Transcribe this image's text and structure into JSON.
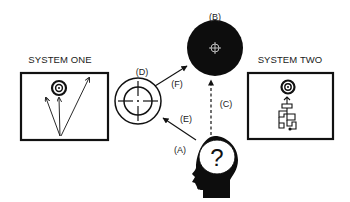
{
  "diagram": {
    "system_one": {
      "title": "SYSTEM ONE",
      "contents": [
        "target-icon",
        "three-arrows-to-target"
      ]
    },
    "system_two": {
      "title": "SYSTEM TWO",
      "contents": [
        "target-icon",
        "maze-path-icon"
      ]
    },
    "nodes": {
      "A": {
        "label": "(A)",
        "icon": "head-with-question-mark-icon"
      },
      "B": {
        "label": "(B)",
        "icon": "black-target-circle-icon"
      },
      "D": {
        "label": "(D)",
        "icon": "crosshair-circle-icon"
      }
    },
    "edges": {
      "C": {
        "label": "(C)",
        "from": "A",
        "to": "B",
        "style": "dashed"
      },
      "E": {
        "label": "(E)",
        "from": "A",
        "to": "D",
        "style": "solid"
      },
      "F": {
        "label": "(F)",
        "from": "D",
        "to": "B",
        "style": "solid"
      }
    },
    "colors": {
      "ink": "#111111",
      "background": "#ffffff"
    }
  }
}
